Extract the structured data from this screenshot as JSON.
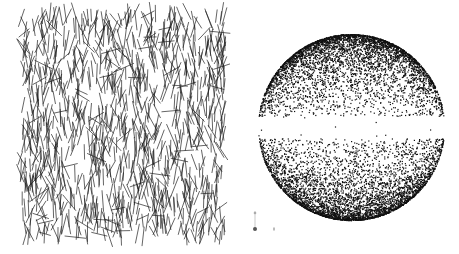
{
  "figure": {
    "width": 459,
    "height": 254,
    "background": "#ffffff",
    "panels": [
      {
        "id": "segments-panel",
        "type": "line-segment-field",
        "description": "random short line segments, predominantly near-vertical orientation",
        "region": {
          "x": 20,
          "y": 10,
          "w": 205,
          "h": 228
        },
        "segment_count": 1100,
        "segment_length_px": [
          12,
          22
        ],
        "orientation_bias": "vertical",
        "orientation_spread_deg": 35,
        "stroke_color": "#1a1a1a",
        "stroke_width": 0.8,
        "seed": 7
      },
      {
        "id": "sphere-panel",
        "type": "point-cloud-sphere",
        "description": "points on a sphere, dense near poles, sparse band at equator",
        "center": {
          "x": 351,
          "y": 127
        },
        "radius": 93,
        "point_count": 9000,
        "equator_gap_fraction": 0.12,
        "point_color": "#111111",
        "point_size": 1.2,
        "seed": 13
      }
    ],
    "axis_indicator": {
      "origin": {
        "x": 255,
        "y": 229
      },
      "vertical_tick_top": 211,
      "horizontal_tick_x": 273,
      "color": "#555555"
    }
  }
}
